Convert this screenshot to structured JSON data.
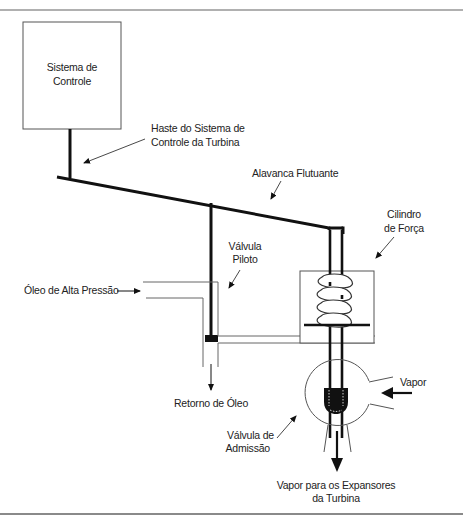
{
  "diagram": {
    "type": "hydraulic turbine governor schematic",
    "labels": {
      "control_system": [
        "Sistema de",
        "Controle"
      ],
      "control_rod": [
        "Haste do Sistema de",
        "Controle da Turbina"
      ],
      "floating_lever": "Alavanca Flutuante",
      "power_cylinder": [
        "Cilindro",
        "de Força"
      ],
      "pilot_valve": [
        "Válvula",
        "Piloto"
      ],
      "high_pressure_oil": "Óleo de Alta Pressão",
      "oil_return": "Retorno de Óleo",
      "steam_in": "Vapor",
      "admission_valve": [
        "Válvula de",
        "Admissão"
      ],
      "steam_out": [
        "Vapor para os Expansores",
        "da Turbina"
      ]
    },
    "colors": {
      "line": "#111111",
      "thin_line": "#555555",
      "text": "#222222",
      "border": "#aaaaaa",
      "background": "#ffffff"
    }
  }
}
